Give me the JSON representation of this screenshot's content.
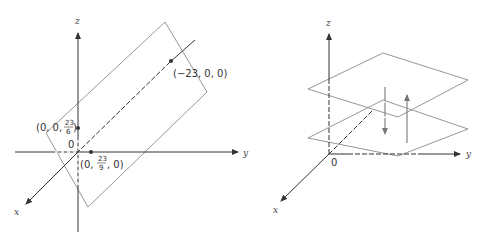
{
  "figure": {
    "left": {
      "axes": {
        "x": "x",
        "y": "y",
        "z": "z"
      },
      "origin_label": "0",
      "points": [
        {
          "id": "p1",
          "label": "(-23, 0, 0)",
          "text": "(−23, 0, 0)"
        },
        {
          "id": "p2",
          "label_prefix": "(0, 0, ",
          "frac_num": "23",
          "frac_den": "6",
          "label_suffix": ")"
        },
        {
          "id": "p3",
          "label_prefix": "(0, ",
          "frac_num": "23",
          "frac_den": "9",
          "label_suffix": ", 0)"
        }
      ],
      "description": "Plane intersecting axes at (-23,0,0), (0,23/9,0), (0,0,23/6)"
    },
    "right": {
      "axes": {
        "x": "x",
        "y": "y",
        "z": "z"
      },
      "origin_label": "0",
      "description": "Two parallel horizontal planes with opposing normal vector arrows"
    },
    "colors": {
      "axis": "#333333",
      "plane": "#8a8a8a",
      "arrow": "#777777"
    }
  }
}
